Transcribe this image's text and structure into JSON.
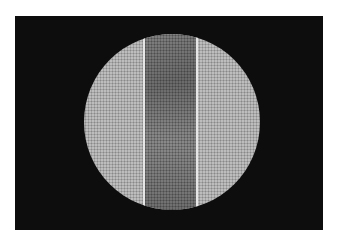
{
  "image": {
    "description": "Circular microscope field of view on black background showing a darker vertical band with bright edges over a lighter dotted mesh",
    "colors": {
      "background": "#0d0d0d",
      "field": "#bdbdbd",
      "band": "#6a6a6a",
      "edge": "#e6e6e6"
    }
  }
}
